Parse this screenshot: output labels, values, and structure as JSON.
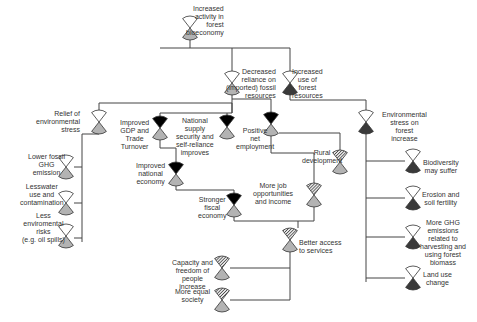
{
  "colors": {
    "line": "#444444",
    "outline": "#333333",
    "top_empty": "#ffffff",
    "black": "#000000",
    "grey": "#b3b3b3",
    "dark": "#3a3a3a",
    "hatch": "#555555"
  },
  "nodes": [
    {
      "id": "increased-activity",
      "x": 190,
      "y": 28,
      "top": "empty",
      "bottom": "grey",
      "label": "Increased\nactivity in\nforest\nbioeconomy",
      "lx": 186,
      "ly": 5,
      "align": "r"
    },
    {
      "id": "decreased-reliance",
      "x": 232,
      "y": 83,
      "top": "empty",
      "bottom": "grey",
      "label": "Decreased\nreliance on\n(imported) fossil\nresources",
      "lx": 226,
      "ly": 68,
      "align": "r"
    },
    {
      "id": "increased-forest-use",
      "x": 290,
      "y": 83,
      "top": "empty",
      "bottom": "dark",
      "label": "Increased\nuse of\nforest\nresources",
      "lx": 292,
      "ly": 68,
      "align": "c"
    },
    {
      "id": "relief-environmental-stress",
      "x": 99,
      "y": 122,
      "top": "empty",
      "bottom": "grey",
      "label": "Relief of\nenvironmental\nstress",
      "lx": 36,
      "ly": 110,
      "align": "r"
    },
    {
      "id": "improved-gdp",
      "x": 160,
      "y": 128,
      "top": "black",
      "bottom": "grey",
      "label": "Improved\nGDP and\nTrade\nTurnover",
      "lx": 120,
      "ly": 119,
      "align": "c"
    },
    {
      "id": "national-supply-security",
      "x": 227,
      "y": 127,
      "top": "black",
      "bottom": "grey",
      "label": "National\nsupply\nsecurity and\nself-reliance\nimproves",
      "lx": 176,
      "ly": 117,
      "align": "c"
    },
    {
      "id": "positive-net-employment",
      "x": 271,
      "y": 124,
      "top": "black",
      "bottom": "grey",
      "label": "Positive\nnet\nemployment",
      "lx": 236,
      "ly": 127,
      "align": "c"
    },
    {
      "id": "environmental-stress-increase",
      "x": 366,
      "y": 122,
      "top": "empty",
      "bottom": "dark",
      "label": "Environmental\nstress on\nforest\nincrease",
      "lx": 382,
      "ly": 111,
      "align": "c"
    },
    {
      "id": "rural-development",
      "x": 340,
      "y": 162,
      "top": "hatch",
      "bottom": "grey",
      "label": "Rural\ndevelopment",
      "lx": 302,
      "ly": 149,
      "align": "c"
    },
    {
      "id": "improved-national-economy",
      "x": 176,
      "y": 174,
      "top": "black",
      "bottom": "grey",
      "label": "Improved\nnational\neconomy",
      "lx": 136,
      "ly": 162,
      "align": "c"
    },
    {
      "id": "more-job-opportunities",
      "x": 314,
      "y": 195,
      "top": "hatch",
      "bottom": "grey",
      "label": "More job\nopportunities\nand income",
      "lx": 253,
      "ly": 182,
      "align": "c"
    },
    {
      "id": "stronger-fiscal-economy",
      "x": 234,
      "y": 205,
      "top": "black",
      "bottom": "grey",
      "label": "Stronger\nfiscal\neconomy",
      "lx": 198,
      "ly": 196,
      "align": "c"
    },
    {
      "id": "better-access-services",
      "x": 290,
      "y": 240,
      "top": "hatch",
      "bottom": "grey",
      "label": "Better access\nto services",
      "lx": 299,
      "ly": 239,
      "align": "l"
    },
    {
      "id": "capacity-freedom",
      "x": 222,
      "y": 268,
      "top": "hatch",
      "bottom": "grey",
      "label": "Capacity and\nfreedom of\npeople\nincrease",
      "lx": 172,
      "ly": 259,
      "align": "c"
    },
    {
      "id": "more-equal-society",
      "x": 222,
      "y": 300,
      "top": "hatch",
      "bottom": "grey",
      "label": "More equal\nsociety",
      "lx": 175,
      "ly": 288,
      "align": "c"
    },
    {
      "id": "lower-fossil-ghg",
      "x": 66,
      "y": 167,
      "top": "empty",
      "bottom": "grey",
      "label": "Lower fossil\nGHG\nemission",
      "lx": 28,
      "ly": 153,
      "align": "c"
    },
    {
      "id": "lesswater-use",
      "x": 66,
      "y": 203,
      "top": "empty",
      "bottom": "grey",
      "label": "Lesswater\nuse and\ncontamination",
      "lx": 20,
      "ly": 183,
      "align": "c"
    },
    {
      "id": "less-environmental-risks",
      "x": 66,
      "y": 236,
      "top": "empty",
      "bottom": "grey",
      "label": "Less\nenviromental\nrisks\n(e.g. oil spills)",
      "lx": 22,
      "ly": 212,
      "align": "c"
    },
    {
      "id": "biodiversity-may-suffer",
      "x": 413,
      "y": 161,
      "top": "empty",
      "bottom": "dark",
      "label": "Biodiversity\nmay suffer",
      "lx": 423,
      "ly": 159,
      "align": "c"
    },
    {
      "id": "erosion-soil-fertility",
      "x": 413,
      "y": 198,
      "top": "empty",
      "bottom": "dark",
      "label": "Erosion and\nsoil fertility",
      "lx": 422,
      "ly": 191,
      "align": "c"
    },
    {
      "id": "more-ghg-emissions",
      "x": 413,
      "y": 237,
      "top": "empty",
      "bottom": "dark",
      "label": "More GHG\nemissions\nrelated to\nharvesting and\nusing forest\nbiomass",
      "lx": 420,
      "ly": 219,
      "align": "c"
    },
    {
      "id": "land-use-change",
      "x": 413,
      "y": 278,
      "top": "empty",
      "bottom": "dark",
      "label": "Land use\nchange",
      "lx": 423,
      "ly": 271,
      "align": "c"
    }
  ],
  "edges": [
    "M190 40 L190 48",
    "M160 48 L290 48",
    "M232 48 L232 72",
    "M290 48 L290 72",
    "M232 94 L232 103",
    "M99 103 L232 103",
    "M99 103 L99 111",
    "M232 103 L232 113",
    "M160 113 L232 113",
    "M160 113 L160 116",
    "M227 113 L227 116",
    "M232 103 L232 113",
    "M232 99 L271 99 L271 113",
    "M290 94 L290 100",
    "M290 100 L366 100 L366 111",
    "M82 134 L82 242",
    "M82 134 L99 134",
    "M74 167 L82 167",
    "M74 203 L82 203",
    "M74 238 L82 238",
    "M160 140 L160 148 L176 148 L176 162",
    "M176 186 L176 190 L234 190 L234 193",
    "M271 136 L271 153 L314 153 L314 183",
    "M279 133 L340 133 L340 150",
    "M234 217 L234 221 L298 221 L298 228",
    "M314 207 L314 221 L298 221",
    "M290 252 L290 300",
    "M230 268 L290 268",
    "M230 300 L290 300",
    "M366 134 L366 282",
    "M366 161 L405 161",
    "M366 198 L405 198",
    "M366 237 L405 237",
    "M366 278 L405 278"
  ]
}
